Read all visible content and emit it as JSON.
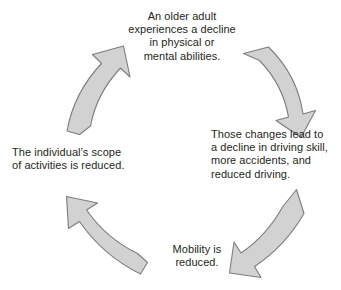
{
  "diagram": {
    "direction": "clockwise",
    "background_color": "#ffffff",
    "text_color": "#231f20",
    "arrow_fill_color": "#d2d2d2",
    "arrow_stroke_color": "#7d7d7d",
    "nodes": [
      {
        "id": "decline",
        "position": "top",
        "text": "An older adult\nexperiences a decline\nin physical or\nmental abilities.",
        "align": "center"
      },
      {
        "id": "driving",
        "position": "right",
        "text": "Those changes lead to\na decline in driving skill,\nmore accidents, and\nreduced driving.",
        "align": "left"
      },
      {
        "id": "mobility",
        "position": "bottom",
        "text": "Mobility is\nreduced.",
        "align": "center"
      },
      {
        "id": "activities",
        "position": "left",
        "text": "The individual’s scope\nof activities is reduced.",
        "align": "left"
      }
    ],
    "arrows": [
      {
        "id": "arrow-decline-to-driving",
        "name": "curved-arrow-top-right",
        "from": "decline",
        "to": "driving",
        "points": "down-right"
      },
      {
        "id": "arrow-driving-to-mobility",
        "name": "curved-arrow-bottom-right",
        "from": "driving",
        "to": "mobility",
        "points": "down-left"
      },
      {
        "id": "arrow-mobility-to-activities",
        "name": "curved-arrow-bottom-left",
        "from": "mobility",
        "to": "activities",
        "points": "up-left"
      },
      {
        "id": "arrow-activities-to-decline",
        "name": "curved-arrow-top-left",
        "from": "activities",
        "to": "decline",
        "points": "up-right"
      }
    ]
  }
}
